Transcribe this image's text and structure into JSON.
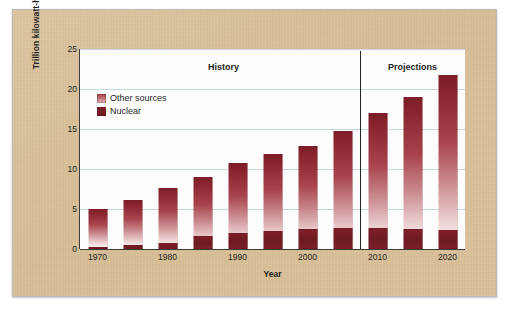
{
  "figure": {
    "background_color": "#d8c09a",
    "plot_background_color": "#fdfdfd",
    "gridline_color": "#c7d6e4"
  },
  "legend": {
    "position": "top-left-inside",
    "items": [
      {
        "label": "Other sources",
        "color": "#a63d46",
        "swatch_name": "legend-swatch-other-sources"
      },
      {
        "label": "Nuclear",
        "color": "#7e1f29",
        "swatch_name": "legend-swatch-nuclear"
      }
    ]
  },
  "annotations": [
    {
      "text": "History",
      "x_value": 1988
    },
    {
      "text": "Projections",
      "x_value": 2015
    }
  ],
  "divider": {
    "x_value": 2007.5,
    "color": "#262626"
  },
  "chart_data": {
    "type": "bar",
    "title": "",
    "subtitle": "",
    "xlabel": "Year",
    "ylabel": "Trillion kilowatt-hours",
    "categories": [
      "1970",
      "1975",
      "1980",
      "1985",
      "1990",
      "1995",
      "2000",
      "2005",
      "2010",
      "2015",
      "2020"
    ],
    "x": [
      1970,
      1975,
      1980,
      1985,
      1990,
      1995,
      2000,
      2005,
      2010,
      2015,
      2020
    ],
    "series": [
      {
        "name": "Nuclear",
        "color": "#7e1f29",
        "values": [
          0.25,
          0.45,
          0.7,
          1.6,
          2.0,
          2.3,
          2.45,
          2.6,
          2.6,
          2.5,
          2.4
        ]
      },
      {
        "name": "Other sources",
        "color": "#a63d46",
        "values": [
          4.75,
          5.65,
          6.9,
          7.4,
          8.8,
          9.6,
          10.45,
          12.2,
          14.4,
          16.5,
          19.3
        ]
      }
    ],
    "totals": [
      5.0,
      6.1,
      7.6,
      9.0,
      10.8,
      11.9,
      12.9,
      14.8,
      17.0,
      19.0,
      21.7
    ],
    "stacked": true,
    "ylim": [
      0,
      25
    ],
    "yticks": [
      0,
      5,
      10,
      15,
      20,
      25
    ],
    "xticks": [
      1970,
      1980,
      1990,
      2000,
      2010,
      2020
    ],
    "xlim": [
      1967.5,
      2022.5
    ],
    "grid": true,
    "legend_position": "upper left"
  }
}
